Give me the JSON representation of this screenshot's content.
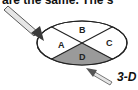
{
  "caption": {
    "top_text": "are the same.   The s"
  },
  "diagram": {
    "sections": [
      {
        "id": "A",
        "label": "A",
        "shaded": false
      },
      {
        "id": "B",
        "label": "B",
        "shaded": false
      },
      {
        "id": "C",
        "label": "C",
        "shaded": false
      },
      {
        "id": "D",
        "label": "D",
        "shaded": true
      }
    ],
    "shade_color": "#9a9a9a",
    "arrows": [
      {
        "id": "arrow-upper-left",
        "points_to": "A"
      },
      {
        "id": "arrow-lower",
        "points_to": "D"
      }
    ],
    "side_label": "3-D"
  }
}
